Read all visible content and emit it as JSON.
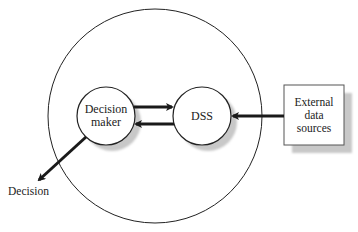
{
  "diagram": {
    "type": "system-context",
    "boundary": {
      "shape": "circle",
      "label": ""
    },
    "nodes": [
      {
        "id": "decision_maker",
        "shape": "circle",
        "lines": [
          "Decision",
          "maker"
        ]
      },
      {
        "id": "dss",
        "shape": "circle",
        "lines": [
          "DSS"
        ]
      },
      {
        "id": "external_data_sources",
        "shape": "rectangle",
        "lines": [
          "External",
          "data",
          "sources"
        ]
      },
      {
        "id": "decision",
        "shape": "text",
        "lines": [
          "Decision"
        ]
      }
    ],
    "edges": [
      {
        "from": "decision_maker",
        "to": "dss",
        "style": "thick-arrow"
      },
      {
        "from": "dss",
        "to": "decision_maker",
        "style": "thick-arrow"
      },
      {
        "from": "external_data_sources",
        "to": "dss",
        "style": "thick-arrow"
      },
      {
        "from": "decision_maker",
        "to": "decision",
        "style": "thick-arrow"
      }
    ],
    "colors": {
      "stroke": "#222222",
      "shadow": "#c8c8c8",
      "fill": "#ffffff"
    }
  }
}
